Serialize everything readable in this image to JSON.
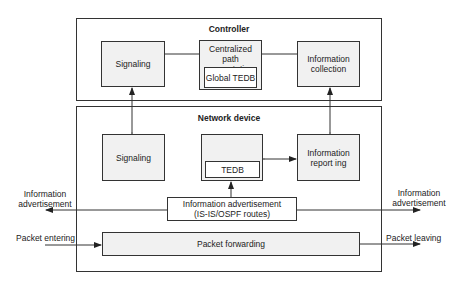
{
  "controller": {
    "title": "Controller",
    "signaling": "Signaling",
    "path_computation": "Centralized path computation",
    "global_tedb": "Global TEDB",
    "info_collection": "Information collection"
  },
  "network_device": {
    "title": "Network device",
    "signaling": "Signaling",
    "tedb": "TEDB",
    "info_reporting": "Information report ing",
    "info_advertisement_line1": "Information advertisement",
    "info_advertisement_line2": "(IS-IS/OSPF routes)",
    "packet_forwarding": "Packet forwarding"
  },
  "external": {
    "left_adv_line1": "Information",
    "left_adv_line2": "advertisement",
    "right_adv_line1": "Information",
    "right_adv_line2": "advertisement",
    "packet_entering": "Packet entering",
    "packet_leaving": "Packet leaving"
  },
  "colors": {
    "box_fill": "#f1f1f1",
    "line": "#333333"
  }
}
